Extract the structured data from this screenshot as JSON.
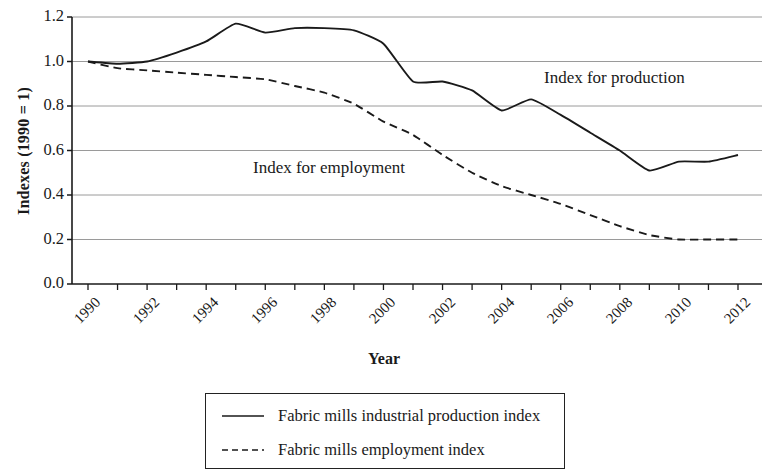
{
  "chart_data": {
    "type": "line",
    "title": "",
    "xlabel": "Year",
    "ylabel": "Indexes (1990 = 1)",
    "xlim": [
      1990,
      2012
    ],
    "ylim": [
      0.0,
      1.2
    ],
    "grid": true,
    "legend_position": "below-plot",
    "y_ticks": [
      "0.0",
      "0.2",
      "0.4",
      "0.6",
      "0.8",
      "1.0",
      "1.2"
    ],
    "y_tick_values": [
      0.0,
      0.2,
      0.4,
      0.6,
      0.8,
      1.0,
      1.2
    ],
    "x_ticks": [
      "1990",
      "1992",
      "1994",
      "1996",
      "1998",
      "2000",
      "2002",
      "2004",
      "2006",
      "2008",
      "2010",
      "2012"
    ],
    "x_tick_values": [
      1990,
      1992,
      1994,
      1996,
      1998,
      2000,
      2002,
      2004,
      2006,
      2008,
      2010,
      2012
    ],
    "x_minor_ticks": [
      1990,
      1991,
      1992,
      1993,
      1994,
      1995,
      1996,
      1997,
      1998,
      1999,
      2000,
      2001,
      2002,
      2003,
      2004,
      2005,
      2006,
      2007,
      2008,
      2009,
      2010,
      2011,
      2012
    ],
    "x": [
      1990,
      1991,
      1992,
      1993,
      1994,
      1995,
      1996,
      1997,
      1998,
      1999,
      2000,
      2001,
      2002,
      2003,
      2004,
      2005,
      2006,
      2007,
      2008,
      2009,
      2010,
      2011,
      2012
    ],
    "series": [
      {
        "name": "Fabric mills industrial production index",
        "style": "solid",
        "color": "#1a1a1a",
        "values": [
          1.0,
          0.99,
          1.0,
          1.04,
          1.09,
          1.17,
          1.13,
          1.15,
          1.15,
          1.14,
          1.08,
          0.91,
          0.91,
          0.87,
          0.78,
          0.83,
          0.76,
          0.68,
          0.6,
          0.51,
          0.55,
          0.55,
          0.58
        ]
      },
      {
        "name": "Fabric mills employment index",
        "style": "dashed",
        "color": "#1a1a1a",
        "values": [
          1.0,
          0.97,
          0.96,
          0.95,
          0.94,
          0.93,
          0.92,
          0.89,
          0.86,
          0.81,
          0.73,
          0.67,
          0.58,
          0.5,
          0.44,
          0.4,
          0.36,
          0.31,
          0.26,
          0.22,
          0.2,
          0.2,
          0.2
        ]
      }
    ],
    "annotations": [
      {
        "text": "Index for production",
        "x": 2006.5,
        "y": 0.93
      },
      {
        "text": "Index for employment",
        "x": 1996.5,
        "y": 0.52
      }
    ]
  },
  "legend": {
    "items": [
      {
        "label": "Fabric mills industrial production index",
        "style": "solid"
      },
      {
        "label": "Fabric mills employment index",
        "style": "dashed"
      }
    ]
  }
}
